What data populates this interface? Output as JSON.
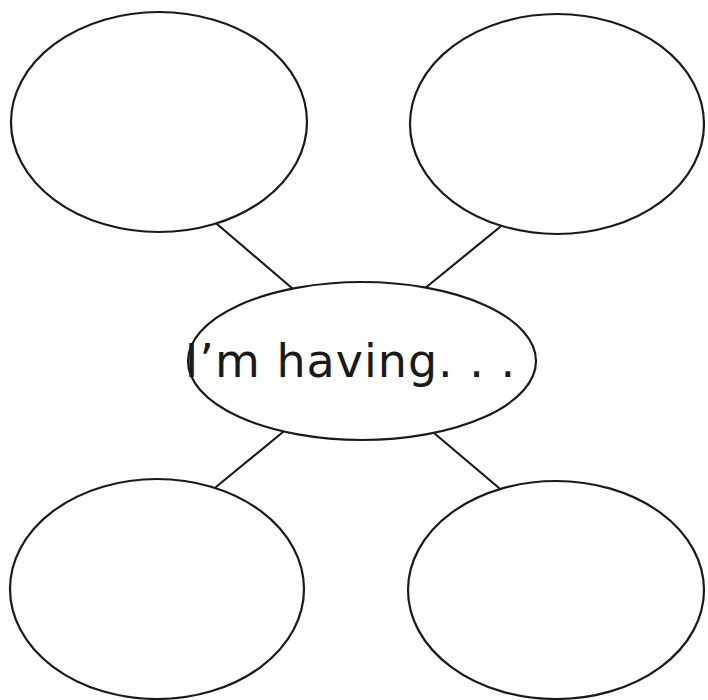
{
  "diagram": {
    "type": "bubble-map",
    "center": {
      "label": "I’m having. . .",
      "cx": 362,
      "cy": 361,
      "rx": 174,
      "ry": 79
    },
    "bubbles": [
      {
        "position": "top-left",
        "label": "",
        "cx": 159,
        "cy": 122,
        "rx": 148,
        "ry": 110
      },
      {
        "position": "top-right",
        "label": "",
        "cx": 557,
        "cy": 124,
        "rx": 147,
        "ry": 110
      },
      {
        "position": "bottom-left",
        "label": "",
        "cx": 157,
        "cy": 589,
        "rx": 147,
        "ry": 110
      },
      {
        "position": "bottom-right",
        "label": "",
        "cx": 556,
        "cy": 590,
        "rx": 148,
        "ry": 109
      }
    ],
    "connectors": [
      {
        "from": "top-left",
        "x1": 217,
        "y1": 224,
        "x2": 293,
        "y2": 289
      },
      {
        "from": "top-right",
        "x1": 500,
        "y1": 227,
        "x2": 424,
        "y2": 289
      },
      {
        "from": "bottom-left",
        "x1": 216,
        "y1": 487,
        "x2": 283,
        "y2": 432
      },
      {
        "from": "bottom-right",
        "x1": 499,
        "y1": 488,
        "x2": 434,
        "y2": 433
      }
    ],
    "colors": {
      "stroke": "#1a1a1a",
      "fill": "#ffffff",
      "background": "#ffffff"
    }
  }
}
